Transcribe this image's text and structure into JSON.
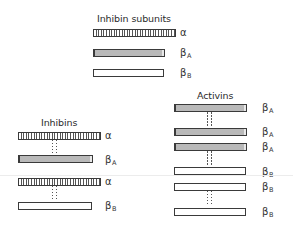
{
  "diagram": {
    "subunits": {
      "title": "Inhibin subunits",
      "items": [
        {
          "name": "α",
          "sub": "",
          "type": "alpha"
        },
        {
          "name": "β",
          "sub": "A",
          "type": "betaA"
        },
        {
          "name": "β",
          "sub": "B",
          "type": "betaB"
        }
      ]
    },
    "inhibins": {
      "title": "Inhibins",
      "dimers": [
        {
          "chains": [
            {
              "name": "α",
              "sub": ""
            },
            {
              "name": "β",
              "sub": "A"
            }
          ],
          "bond": "disulfide"
        },
        {
          "chains": [
            {
              "name": "α",
              "sub": ""
            },
            {
              "name": "β",
              "sub": "B"
            }
          ],
          "bond": "disulfide"
        }
      ]
    },
    "activins": {
      "title": "Activins",
      "dimers": [
        {
          "chains": [
            {
              "name": "β",
              "sub": "A"
            },
            {
              "name": "β",
              "sub": "A"
            }
          ],
          "bond": "disulfide"
        },
        {
          "chains": [
            {
              "name": "β",
              "sub": "A"
            },
            {
              "name": "β",
              "sub": "B"
            }
          ],
          "bond": "disulfide"
        },
        {
          "chains": [
            {
              "name": "β",
              "sub": "B"
            },
            {
              "name": "β",
              "sub": "B"
            }
          ],
          "bond": "disulfide"
        }
      ]
    },
    "labels": {
      "alpha": "α",
      "beta": "β",
      "sub_A": "A",
      "sub_B": "B"
    },
    "colors": {
      "beta_A_fill": "#b9b9b9",
      "beta_B_fill": "#ffffff",
      "alpha_hatch": "#555555",
      "outline": "#3a3a3a"
    }
  }
}
